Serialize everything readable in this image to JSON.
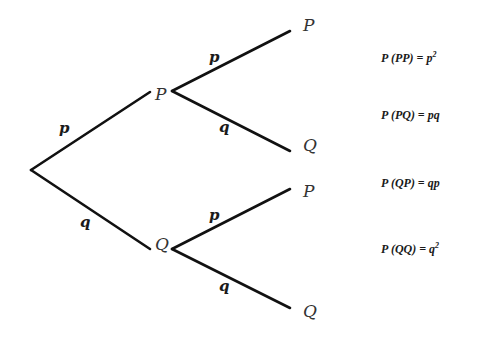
{
  "diagram": {
    "type": "probability-tree",
    "nodes": {
      "level1_top": "P",
      "level1_bottom": "Q",
      "leaf1": "P",
      "leaf2": "Q",
      "leaf3": "P",
      "leaf4": "Q"
    },
    "edges": {
      "root_to_P": "p",
      "root_to_Q": "q",
      "P_to_P": "p",
      "P_to_Q": "q",
      "Q_to_P": "p",
      "Q_to_Q": "q"
    },
    "outcomes": [
      {
        "lhs": "P (PP) = ",
        "base": "p",
        "sup": "2"
      },
      {
        "lhs": "P (PQ) = ",
        "base": "pq",
        "sup": ""
      },
      {
        "lhs": "P (QP) = ",
        "base": "qp",
        "sup": ""
      },
      {
        "lhs": "P (QQ) = ",
        "base": "q",
        "sup": "2"
      }
    ],
    "line_color": "#111111"
  }
}
